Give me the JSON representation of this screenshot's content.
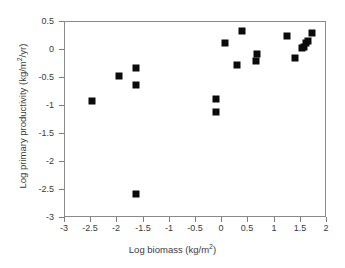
{
  "chart_data": {
    "type": "scatter",
    "title": "",
    "xlabel": "Log biomass (kg/m2)",
    "ylabel": "Log primary productivity (kg/m2/yr)",
    "xlabel_parts": {
      "pre": "Log biomass (kg/m",
      "sup": "2",
      "post": ")"
    },
    "ylabel_parts": {
      "pre": "Log primary productivity (kg/m",
      "sup": "2",
      "post": "/yr)"
    },
    "xlim": [
      -3,
      2
    ],
    "ylim": [
      -3,
      0.5
    ],
    "xticks": [
      -3,
      -2.5,
      -2,
      -1.5,
      -1,
      -0.5,
      0,
      0.5,
      1,
      1.5,
      2
    ],
    "xtick_labels": [
      "-3",
      "-2.5",
      "-2",
      "-1.5",
      "-1",
      "-0.5",
      "0",
      "0.5",
      "1",
      "1.5",
      "2"
    ],
    "yticks": [
      0.5,
      0,
      -0.5,
      -1,
      -1.5,
      -2,
      -2.5,
      -3
    ],
    "ytick_labels": [
      "0.5",
      "0",
      "-0.5",
      "-1",
      "-1.5",
      "-2",
      "-2.5",
      "-3"
    ],
    "grid": false,
    "legend": null,
    "marker": "square",
    "marker_color": "#0b0b0b",
    "marker_size_px": 7,
    "n_points": 19,
    "x": [
      -2.49,
      -1.96,
      -1.65,
      -1.65,
      -1.65,
      -0.12,
      -0.12,
      0.05,
      0.28,
      0.37,
      0.65,
      0.67,
      1.24,
      1.38,
      1.53,
      1.57,
      1.59,
      1.63,
      1.72
    ],
    "y": [
      -0.91,
      -0.46,
      -0.32,
      -0.62,
      -2.57,
      -0.88,
      -1.11,
      0.13,
      -0.27,
      0.34,
      -0.2,
      -0.08,
      0.25,
      -0.14,
      0.03,
      0.05,
      0.12,
      0.16,
      0.3
    ],
    "points": [
      {
        "x": -2.49,
        "y": -0.91
      },
      {
        "x": -1.96,
        "y": -0.46
      },
      {
        "x": -1.65,
        "y": -0.32
      },
      {
        "x": -1.65,
        "y": -0.62
      },
      {
        "x": -1.65,
        "y": -2.57
      },
      {
        "x": -0.12,
        "y": -0.88
      },
      {
        "x": -0.12,
        "y": -1.11
      },
      {
        "x": 0.05,
        "y": 0.13
      },
      {
        "x": 0.28,
        "y": -0.27
      },
      {
        "x": 0.37,
        "y": 0.34
      },
      {
        "x": 0.65,
        "y": -0.2
      },
      {
        "x": 0.67,
        "y": -0.08
      },
      {
        "x": 1.24,
        "y": 0.25
      },
      {
        "x": 1.38,
        "y": -0.14
      },
      {
        "x": 1.53,
        "y": 0.03
      },
      {
        "x": 1.57,
        "y": 0.05
      },
      {
        "x": 1.59,
        "y": 0.12
      },
      {
        "x": 1.63,
        "y": 0.16
      },
      {
        "x": 1.72,
        "y": 0.3
      }
    ]
  }
}
